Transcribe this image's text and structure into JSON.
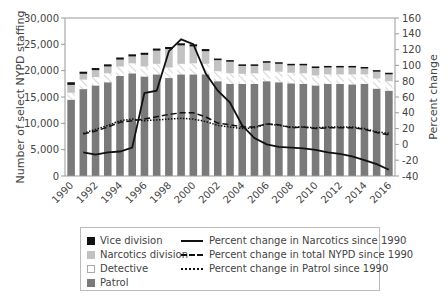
{
  "chart_data": {
    "type": "bar",
    "subtype": "stacked bar with secondary-axis lines",
    "title": "",
    "xlabel": "",
    "ylabel": "Number of select NYPD staffing",
    "y2label": "Percent change",
    "ylim": [
      0,
      30000
    ],
    "y2lim": [
      -40,
      160
    ],
    "yticks": [
      "0",
      "5,000",
      "10,000",
      "15,000",
      "20,000",
      "25,000",
      "30,000"
    ],
    "y2ticks": [
      "-40",
      "-20",
      "0",
      "20",
      "40",
      "60",
      "80",
      "100",
      "120",
      "140",
      "160"
    ],
    "xticks": [
      "1990",
      "1992",
      "1994",
      "1996",
      "1998",
      "2000",
      "2002",
      "2004",
      "2006",
      "2008",
      "2010",
      "2012",
      "2014",
      "2016"
    ],
    "categories": [
      "1990",
      "1991",
      "1992",
      "1993",
      "1994",
      "1995",
      "1996",
      "1997",
      "1998",
      "1999",
      "2000",
      "2001",
      "2002",
      "2003",
      "2004",
      "2005",
      "2006",
      "2007",
      "2008",
      "2009",
      "2010",
      "2011",
      "2012",
      "2013",
      "2014",
      "2015",
      "2016"
    ],
    "series": [
      {
        "name": "Patrol",
        "kind": "bar",
        "color": "#7a7a7a",
        "values": [
          14500,
          16500,
          17200,
          17800,
          19000,
          19500,
          18900,
          19300,
          18600,
          19300,
          19300,
          19300,
          18000,
          17500,
          17500,
          17500,
          18000,
          17800,
          17600,
          17500,
          17200,
          17500,
          17500,
          17400,
          17500,
          16600,
          16200
        ]
      },
      {
        "name": "Detective",
        "kind": "bar",
        "color": "#ffffff",
        "values": [
          1300,
          1800,
          1600,
          1700,
          1800,
          1900,
          1900,
          2000,
          2000,
          2000,
          2100,
          2000,
          1900,
          2000,
          1900,
          2000,
          2000,
          2000,
          2000,
          2000,
          1900,
          1800,
          1800,
          1900,
          1800,
          1900,
          1800
        ]
      },
      {
        "name": "Narcotics division",
        "kind": "bar",
        "color": "#c2c2c2",
        "values": [
          1500,
          1100,
          1300,
          1300,
          1300,
          1300,
          2200,
          2500,
          3500,
          3500,
          3200,
          2400,
          2100,
          2200,
          1500,
          1400,
          1500,
          1500,
          1400,
          1500,
          1400,
          1300,
          1300,
          1300,
          1100,
          1300,
          1300
        ]
      },
      {
        "name": "Vice division",
        "kind": "bar",
        "color": "#111111",
        "values": [
          500,
          400,
          400,
          400,
          400,
          400,
          400,
          400,
          400,
          400,
          400,
          400,
          300,
          300,
          300,
          300,
          300,
          300,
          300,
          300,
          300,
          300,
          300,
          300,
          300,
          300,
          300
        ]
      },
      {
        "name": "Percent change in Narcotics since 1990",
        "kind": "line",
        "axis": "right",
        "style": "solid",
        "values": [
          null,
          -10,
          -13,
          -10,
          -9,
          -4,
          65,
          68,
          118,
          133,
          127,
          90,
          68,
          53,
          24,
          8,
          0,
          -3,
          -4,
          -5,
          -7,
          -10,
          -12,
          -15,
          -20,
          -25,
          -32
        ]
      },
      {
        "name": "Percent change in total NYPD since 1990",
        "kind": "line",
        "axis": "right",
        "style": "dashed",
        "values": [
          null,
          13,
          17,
          22,
          28,
          30,
          32,
          35,
          38,
          40,
          40,
          35,
          27,
          25,
          22,
          22,
          26,
          25,
          21,
          22,
          20,
          21,
          21,
          21,
          19,
          15,
          12
        ]
      },
      {
        "name": "Percent change in Patrol since 1990",
        "kind": "line",
        "axis": "right",
        "style": "dotted",
        "values": [
          null,
          14,
          19,
          24,
          30,
          32,
          30,
          31,
          32,
          33,
          32,
          29,
          24,
          22,
          20,
          21,
          26,
          24,
          22,
          22,
          21,
          22,
          22,
          22,
          20,
          16,
          14
        ]
      }
    ],
    "legend_position": "below",
    "grid": false
  },
  "legend": {
    "items": [
      {
        "label": "Vice division",
        "type": "swatch",
        "color": "#111111"
      },
      {
        "label": "Narcotics division",
        "type": "swatch",
        "color": "#c2c2c2"
      },
      {
        "label": "Detective",
        "type": "swatch",
        "color": "#ffffff"
      },
      {
        "label": "Patrol",
        "type": "swatch",
        "color": "#7a7a7a"
      },
      {
        "label": "Percent change in Narcotics since 1990",
        "type": "line",
        "style": "solid"
      },
      {
        "label": "Percent change in total NYPD since 1990",
        "type": "line",
        "style": "dashed"
      },
      {
        "label": "Percent change in Patrol since 1990",
        "type": "line",
        "style": "dotted"
      }
    ]
  }
}
